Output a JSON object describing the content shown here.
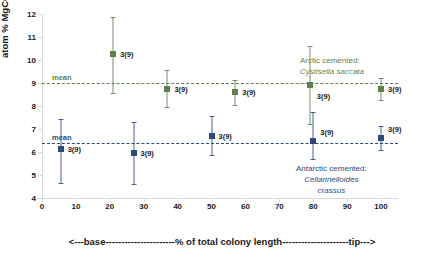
{
  "chart_data": {
    "type": "scatter",
    "title": "",
    "xlabel": "<---base----------------------% of total colony length---------------------tip--->",
    "ylabel": "atom % MgCO3",
    "xlim": [
      0,
      105
    ],
    "ylim": [
      4,
      12
    ],
    "xticks": [
      0,
      10,
      20,
      30,
      40,
      50,
      60,
      70,
      80,
      90,
      100
    ],
    "yticks": [
      4,
      5,
      6,
      7,
      8,
      9,
      10,
      11,
      12
    ],
    "grid": false,
    "legend_position": "inside-right",
    "series": [
      {
        "name": "Arctic cemented: Cystisella saccata",
        "color": "#5f7f4f",
        "marker": "square",
        "mean": 9.0,
        "mean_label": "mean",
        "points": [
          {
            "x": 21,
            "y": 10.25,
            "lo": 8.55,
            "hi": 11.85,
            "label": "3(9)"
          },
          {
            "x": 37,
            "y": 8.72,
            "lo": 7.95,
            "hi": 9.55,
            "label": "3(9)"
          },
          {
            "x": 57,
            "y": 8.6,
            "lo": 8.05,
            "hi": 9.15,
            "label": "3(9)"
          },
          {
            "x": 79,
            "y": 8.9,
            "lo": 7.2,
            "hi": 10.6,
            "label": "3(9)"
          },
          {
            "x": 100,
            "y": 8.72,
            "lo": 8.25,
            "hi": 9.2,
            "label": "3(9)"
          }
        ]
      },
      {
        "name": "Antarctic cemented: Cellarinelloides crassus",
        "color": "#2d4a7c",
        "marker": "square",
        "mean": 6.4,
        "mean_label": "mean",
        "points": [
          {
            "x": 5.5,
            "y": 6.15,
            "lo": 4.65,
            "hi": 7.45,
            "label": "3(9)"
          },
          {
            "x": 27,
            "y": 5.95,
            "lo": 4.62,
            "hi": 7.3,
            "label": "3(9)"
          },
          {
            "x": 50,
            "y": 6.7,
            "lo": 5.85,
            "hi": 7.55,
            "label": "3(9)"
          },
          {
            "x": 80,
            "y": 6.5,
            "lo": 5.7,
            "hi": 7.75,
            "label": "3(9)"
          },
          {
            "x": 100,
            "y": 6.62,
            "lo": 6.1,
            "hi": 7.15,
            "label": "3(9)"
          }
        ]
      }
    ],
    "legends": [
      {
        "line1": "Arctic cemented:",
        "line2": "Cystisella saccata",
        "line3": "",
        "color": "#5f7f4f"
      },
      {
        "line1": "Antarctic cemented:",
        "line2": "Cellarinelloides",
        "line3": "crassus",
        "color": "#2d4a7c"
      }
    ]
  }
}
